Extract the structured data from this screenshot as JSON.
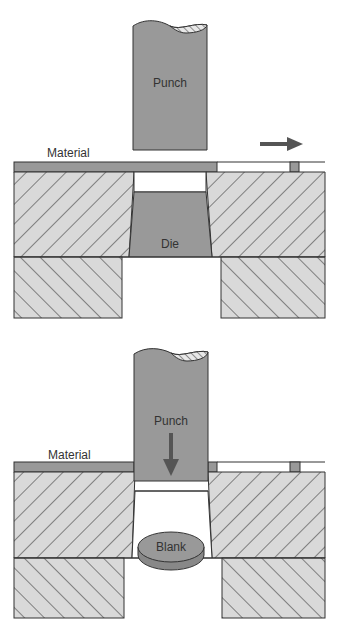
{
  "colors": {
    "background": "#ffffff",
    "steel_fill": "#d9d9d9",
    "part_fill": "#999999",
    "outline": "#333333",
    "hatch": "#333333",
    "arrow": "#555555"
  },
  "panels": [
    {
      "id": "before-cut",
      "labels": {
        "punch": "Punch",
        "material": "Material",
        "die": "Die"
      },
      "arrow_direction": "right",
      "arrow_meaning": "material feed direction"
    },
    {
      "id": "after-cut",
      "labels": {
        "punch": "Punch",
        "material": "Material",
        "blank": "Blank"
      },
      "arrow_direction": "down",
      "arrow_meaning": "punch stroke direction"
    }
  ]
}
